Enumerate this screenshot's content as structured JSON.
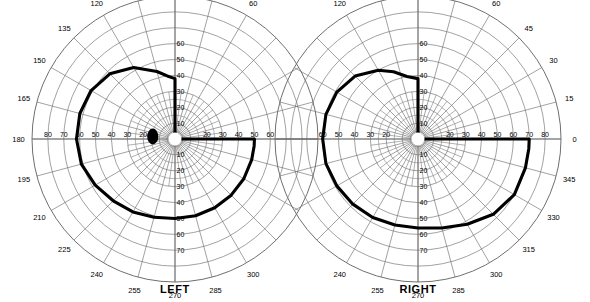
{
  "chart_data": {
    "type": "scatter",
    "title": "",
    "subtitle": "",
    "xlabel": "",
    "ylabel": "",
    "grid": true,
    "legend": false,
    "coordinate_system": "polar",
    "radial_unit": "degrees",
    "radial_max": 90,
    "radial_ticks": [
      10,
      20,
      30,
      40,
      50,
      60,
      70,
      80
    ],
    "angular_unit": "degrees",
    "angular_tick_step": 15,
    "charts": [
      {
        "name": "LEFT",
        "meridian_labels_outer": [
          "135",
          "150",
          "165",
          "180",
          "195",
          "210",
          "225",
          "240",
          "255",
          "270",
          "285",
          "300",
          "120",
          "105",
          "90",
          "75",
          "60"
        ],
        "radial_labels_left": [
          "80",
          "70",
          "60",
          "50",
          "40",
          "30",
          "20"
        ],
        "radial_labels_right": [
          "20",
          "30",
          "40",
          "50",
          "60"
        ],
        "radial_labels_up": [
          "10",
          "20",
          "30",
          "40",
          "50",
          "60"
        ],
        "radial_labels_down": [
          "10",
          "20",
          "30",
          "40",
          "50",
          "60",
          "70"
        ],
        "blind_spot": {
          "present": true,
          "angle_deg": 180,
          "radius_deg": 14,
          "width_deg": 7,
          "height_deg": 10
        },
        "isopter": {
          "name": "outer isopter",
          "points_deg": [
            [
              0,
              50
            ],
            [
              8,
              50
            ],
            [
              15,
              50
            ],
            [
              90,
              38
            ],
            [
              90,
              38
            ],
            [
              97,
              40
            ],
            [
              105,
              44
            ],
            [
              120,
              52
            ],
            [
              135,
              58
            ],
            [
              150,
              61
            ],
            [
              165,
              62
            ],
            [
              180,
              62
            ],
            [
              195,
              61
            ],
            [
              210,
              58
            ],
            [
              225,
              55
            ],
            [
              240,
              53
            ],
            [
              255,
              51
            ],
            [
              270,
              50
            ],
            [
              285,
              50
            ],
            [
              300,
              50
            ],
            [
              315,
              50
            ],
            [
              330,
              50
            ],
            [
              345,
              50
            ],
            [
              355,
              50
            ]
          ],
          "notes": "superior-nasal step: vertical cut at 90 deg meridian"
        }
      },
      {
        "name": "RIGHT",
        "meridian_labels_outer": [
          "120",
          "105",
          "90",
          "75",
          "60",
          "45",
          "30",
          "15",
          "0",
          "345",
          "330",
          "315",
          "300",
          "285",
          "270",
          "255",
          "240"
        ],
        "radial_labels_left": [
          "60",
          "50",
          "40",
          "30",
          "20"
        ],
        "radial_labels_right": [
          "20",
          "30",
          "40",
          "50",
          "60",
          "70",
          "80"
        ],
        "radial_labels_up": [
          "10",
          "20",
          "30",
          "40",
          "50",
          "60"
        ],
        "radial_labels_down": [
          "10",
          "20",
          "30",
          "40",
          "50",
          "60",
          "70"
        ],
        "blind_spot": {
          "present": false
        },
        "isopter": {
          "name": "outer isopter",
          "points_deg": [
            [
              0,
              70
            ],
            [
              8,
              70
            ],
            [
              14,
              70
            ],
            [
              90,
              38
            ],
            [
              90,
              38
            ],
            [
              100,
              40
            ],
            [
              110,
              45
            ],
            [
              120,
              50
            ],
            [
              135,
              56
            ],
            [
              150,
              59
            ],
            [
              165,
              60
            ],
            [
              180,
              60
            ],
            [
              195,
              60
            ],
            [
              210,
              59
            ],
            [
              225,
              58
            ],
            [
              240,
              57
            ],
            [
              255,
              56
            ],
            [
              270,
              56
            ],
            [
              285,
              58
            ],
            [
              300,
              62
            ],
            [
              315,
              67
            ],
            [
              330,
              70
            ],
            [
              345,
              70
            ],
            [
              355,
              70
            ]
          ],
          "notes": "superior-nasal step: vertical cut at 90 deg meridian"
        }
      }
    ]
  },
  "labels": {
    "left_eye": "LEFT",
    "right_eye": "RIGHT"
  },
  "colors": {
    "grid": "#6f6f6f",
    "axis": "#6f6f6f",
    "isopter": "#000000",
    "text": "#000000",
    "background": "#ffffff"
  }
}
